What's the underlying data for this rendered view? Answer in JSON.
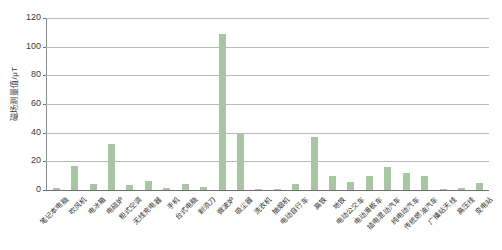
{
  "chart_data": {
    "type": "bar",
    "title": "",
    "xlabel": "",
    "ylabel": "磁场测量值/μT",
    "ylim": [
      0,
      120
    ],
    "ytick_labels": [
      "0",
      "20",
      "40",
      "60",
      "80",
      "100",
      "120"
    ],
    "ytick_values": [
      0,
      20,
      40,
      60,
      80,
      100,
      120
    ],
    "grid": true,
    "legend": "none",
    "bar_color": "#a9c6a4",
    "gridline_color": "#b9b9b9",
    "axis_color": "#6f6f6f",
    "categories": [
      "笔记本电脑",
      "吹风机",
      "电冰箱",
      "电磁炉",
      "柜式空调",
      "无线充电器",
      "手机",
      "台式电脑",
      "剃须刀",
      "微波炉",
      "吸尘器",
      "洗衣机",
      "抽烟机",
      "电动自行车",
      "高铁",
      "地铁",
      "电动公交车",
      "电动滑板车",
      "插电混动汽车",
      "纯电动汽车",
      "传统燃油汽车",
      "广播站天线",
      "高压线",
      "变电站"
    ],
    "values": [
      1.5,
      17,
      4.5,
      32,
      3.5,
      6,
      1.5,
      4,
      2,
      109,
      40,
      1,
      1,
      4,
      37,
      10,
      5.5,
      9.5,
      16,
      12,
      10,
      1,
      1.2,
      5
    ]
  }
}
